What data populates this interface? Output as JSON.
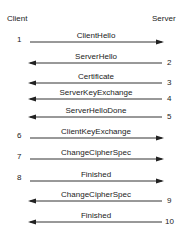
{
  "diagram": {
    "client_label": "Client",
    "server_label": "Server",
    "messages": [
      {
        "n": "1",
        "label": "ClientHello",
        "dir": "right",
        "y": 42
      },
      {
        "n": "2",
        "label": "ServerHello",
        "dir": "left",
        "y": 63
      },
      {
        "n": "3",
        "label": "Certificate",
        "dir": "left",
        "y": 83
      },
      {
        "n": "4",
        "label": "ServerKeyExchange",
        "dir": "left",
        "y": 99
      },
      {
        "n": "5",
        "label": "ServerHelloDone",
        "dir": "left",
        "y": 117
      },
      {
        "n": "6",
        "label": "ClientKeyExchange",
        "dir": "right",
        "y": 138
      },
      {
        "n": "7",
        "label": "ChangeCipherSpec",
        "dir": "right",
        "y": 159
      },
      {
        "n": "8",
        "label": "Finished",
        "dir": "right",
        "y": 181
      },
      {
        "n": "9",
        "label": "ChangeCipherSpec",
        "dir": "left",
        "y": 201
      },
      {
        "n": "10",
        "label": "Finished",
        "dir": "left",
        "y": 222
      }
    ]
  }
}
